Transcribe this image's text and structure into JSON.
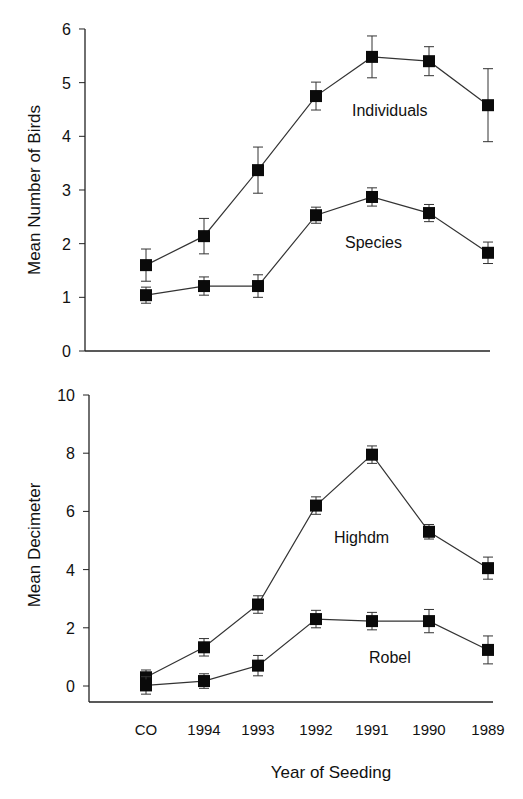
{
  "figure": {
    "xlabel": "Year of Seeding",
    "categories": [
      "CO",
      "1994",
      "1993",
      "1992",
      "1991",
      "1990",
      "1989"
    ]
  },
  "chart_data": [
    {
      "type": "line",
      "title": "",
      "xlabel": "Year of Seeding",
      "ylabel": "Mean Number of Birds",
      "categories": [
        "CO",
        "1994",
        "1993",
        "1992",
        "1991",
        "1990",
        "1989"
      ],
      "ylim": [
        0,
        6
      ],
      "yticks": [
        0,
        1,
        2,
        3,
        4,
        5,
        6
      ],
      "grid": false,
      "legend": "inline labels",
      "series": [
        {
          "name": "Individuals",
          "values": [
            1.6,
            2.14,
            3.37,
            4.75,
            5.48,
            5.4,
            4.58
          ],
          "error": [
            0.3,
            0.33,
            0.43,
            0.26,
            0.39,
            0.27,
            0.68
          ],
          "label_pos": [
            352,
            116
          ]
        },
        {
          "name": "Species",
          "values": [
            1.04,
            1.21,
            1.21,
            2.53,
            2.87,
            2.57,
            1.83
          ],
          "error": [
            0.15,
            0.17,
            0.21,
            0.15,
            0.17,
            0.16,
            0.2
          ],
          "label_pos": [
            345,
            248
          ]
        }
      ]
    },
    {
      "type": "line",
      "title": "",
      "xlabel": "Year of Seeding",
      "ylabel": "Mean Decimeter",
      "categories": [
        "CO",
        "1994",
        "1993",
        "1992",
        "1991",
        "1990",
        "1989"
      ],
      "ylim": [
        -0.55,
        10
      ],
      "yticks": [
        0,
        2,
        4,
        6,
        8,
        10
      ],
      "grid": false,
      "legend": "inline labels",
      "series": [
        {
          "name": "Highdm",
          "values": [
            0.3,
            1.33,
            2.8,
            6.2,
            7.95,
            5.3,
            4.05
          ],
          "error": [
            0.25,
            0.3,
            0.3,
            0.3,
            0.3,
            0.25,
            0.38
          ],
          "label_pos": [
            334,
            543
          ]
        },
        {
          "name": "Robel",
          "values": [
            0.02,
            0.17,
            0.7,
            2.3,
            2.23,
            2.23,
            1.24
          ],
          "error": [
            0.3,
            0.25,
            0.35,
            0.3,
            0.3,
            0.4,
            0.48
          ],
          "label_pos": [
            369,
            663
          ]
        }
      ]
    }
  ]
}
